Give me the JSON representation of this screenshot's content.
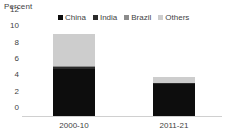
{
  "chart_data": {
    "type": "bar",
    "stacked": true,
    "title": "",
    "subtitle": "",
    "unit_label": "Percent",
    "xlabel": "",
    "ylabel": "Percent",
    "categories": [
      "2000-10",
      "2011-21"
    ],
    "series": [
      {
        "name": "China",
        "color": "#0d0d0d",
        "values": [
          5.7,
          3.9
        ]
      },
      {
        "name": "India",
        "color": "#2b2b2b",
        "values": [
          0.3,
          0.12
        ]
      },
      {
        "name": "Brazil",
        "color": "#8c8c8c",
        "values": [
          0.12,
          0.05
        ]
      },
      {
        "name": "Others",
        "color": "#cdcdcd",
        "values": [
          3.98,
          0.73
        ]
      }
    ],
    "totals": [
      10.1,
      4.8
    ],
    "ylim": [
      0,
      12
    ],
    "yticks": [
      0,
      2,
      4,
      6,
      8,
      10,
      12
    ],
    "ytick_labels": [
      "0",
      "2",
      "4",
      "6",
      "8",
      "10",
      "12"
    ],
    "grid": false,
    "legend_position": "top",
    "legend": [
      "China",
      "India",
      "Brazil",
      "Others"
    ]
  },
  "colors": {
    "axis_text": "#3f3f3f",
    "baseline": "#d0d0d0",
    "background": "#ffffff"
  }
}
